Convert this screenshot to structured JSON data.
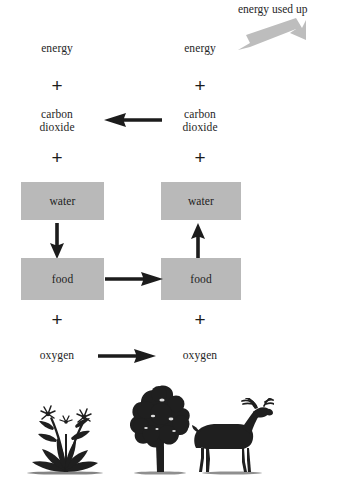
{
  "diagram": {
    "title_cut_off": "",
    "top_caption": "energy used up",
    "colors": {
      "box_fill": "#b9b9b9",
      "arrow_dark": "#1c1c1c",
      "arrow_gray": "#bdbdbd",
      "text": "#262626",
      "silhouette": "#1f1f1f",
      "background": "#ffffff"
    },
    "columns": [
      {
        "id": "left",
        "name": "photosynthesis-column",
        "items": [
          {
            "kind": "text",
            "label": "energy"
          },
          {
            "kind": "operator",
            "label": "+"
          },
          {
            "kind": "text",
            "label": "carbon\ndioxide"
          },
          {
            "kind": "operator",
            "label": "+"
          },
          {
            "kind": "box",
            "label": "water"
          },
          {
            "kind": "box",
            "label": "food"
          },
          {
            "kind": "operator",
            "label": "+"
          },
          {
            "kind": "text",
            "label": "oxygen"
          }
        ]
      },
      {
        "id": "right",
        "name": "respiration-column",
        "items": [
          {
            "kind": "text",
            "label": "energy"
          },
          {
            "kind": "operator",
            "label": "+"
          },
          {
            "kind": "text",
            "label": "carbon\ndioxide"
          },
          {
            "kind": "operator",
            "label": "+"
          },
          {
            "kind": "box",
            "label": "water"
          },
          {
            "kind": "box",
            "label": "food"
          },
          {
            "kind": "operator",
            "label": "+"
          },
          {
            "kind": "text",
            "label": "oxygen"
          }
        ]
      }
    ],
    "arrows": [
      {
        "name": "energy-used-up-arrow",
        "direction": "up-right",
        "style": "gray"
      },
      {
        "name": "carbon-dioxide-transfer-arrow",
        "direction": "left",
        "style": "dark"
      },
      {
        "name": "left-water-to-food-arrow",
        "direction": "down",
        "style": "dark"
      },
      {
        "name": "food-transfer-arrow",
        "direction": "right",
        "style": "dark"
      },
      {
        "name": "right-food-to-water-arrow",
        "direction": "up",
        "style": "dark"
      },
      {
        "name": "oxygen-transfer-arrow",
        "direction": "right",
        "style": "dark"
      }
    ],
    "illustrations": [
      {
        "name": "flowering-plant-silhouette",
        "label": "flowering plant"
      },
      {
        "name": "tree-silhouette",
        "label": "tree"
      },
      {
        "name": "deer-silhouette",
        "label": "deer"
      }
    ]
  }
}
